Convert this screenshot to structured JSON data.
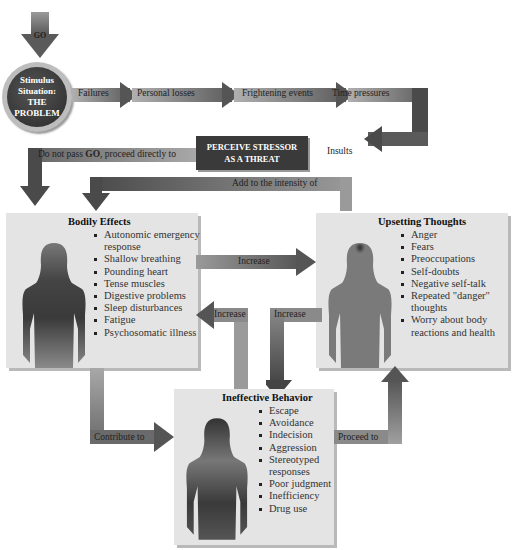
{
  "start": {
    "go_label": "GO"
  },
  "stimulus": {
    "line1": "Stimulus",
    "line2": "Situation:",
    "line3": "THE",
    "line4": "PROBLEM"
  },
  "stressors": [
    "Failures",
    "Personal losses",
    "Frightening events",
    "Time pressures",
    "Insults"
  ],
  "perceive": {
    "line1": "PERCEIVE STRESSOR",
    "line2": "AS A THREAT"
  },
  "do_not_pass": {
    "pre": "Do not pass ",
    "bold": "GO",
    "post": ", proceed directly to"
  },
  "add_to": "Add to the intensity of",
  "bodily": {
    "title": "Bodily Effects",
    "items": [
      "Autonomic emergency response",
      "Shallow breathing",
      "Pounding heart",
      "Tense muscles",
      "Digestive problems",
      "Sleep disturbances",
      "Fatigue",
      "Psychosomatic illness"
    ]
  },
  "thoughts": {
    "title": "Upsetting Thoughts",
    "items": [
      "Anger",
      "Fears",
      "Preoccupations",
      "Self-doubts",
      "Negative self-talk",
      "Repeated \"danger\" thoughts",
      "Worry about body reactions and health"
    ]
  },
  "behavior": {
    "title": "Ineffective Behavior",
    "items": [
      "Escape",
      "Avoidance",
      "Indecision",
      "Aggression",
      "Stereotyped responses",
      "Poor judgment",
      "Inefficiency",
      "Drug use"
    ]
  },
  "arrows": {
    "body_to_thoughts": "Increase",
    "behavior_to_body": "Increase",
    "thoughts_to_behavior": "Increase",
    "body_to_behavior": "Contribute to",
    "behavior_to_thoughts": "Proceed to"
  },
  "colors": {
    "dark_arrow": "#4a4a4a",
    "mid_arrow": "#8a8a8a",
    "light_arrow": "#a8a8a8",
    "panel": "#e4e4e4",
    "figure": "#7a7a7a",
    "figure_dark": "#2e2e2e"
  }
}
